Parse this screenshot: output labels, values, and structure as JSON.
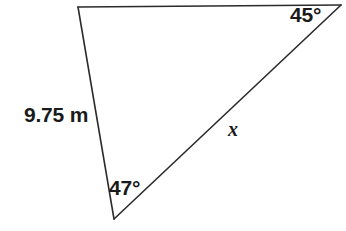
{
  "figure": {
    "type": "triangle-diagram",
    "background_color": "#ffffff",
    "stroke_color": "#2b2b2b",
    "stroke_width": 1.6,
    "width": 346,
    "height": 231
  },
  "labels": {
    "side_known": "9.75 m",
    "angle_top_right": "45°",
    "angle_bottom": "47°",
    "side_unknown": "x"
  },
  "geometry": {
    "vertices": {
      "top_left": {
        "x": 78,
        "y": 7
      },
      "top_right": {
        "x": 341,
        "y": 5
      },
      "bottom": {
        "x": 114,
        "y": 219
      }
    },
    "edges": [
      {
        "name": "top-edge",
        "from": "top_left",
        "to": "top_right"
      },
      {
        "name": "left-edge",
        "from": "top_left",
        "to": "bottom",
        "label": "9.75 m"
      },
      {
        "name": "hypotenuse-edge",
        "from": "bottom",
        "to": "top_right",
        "label": "x"
      }
    ]
  }
}
